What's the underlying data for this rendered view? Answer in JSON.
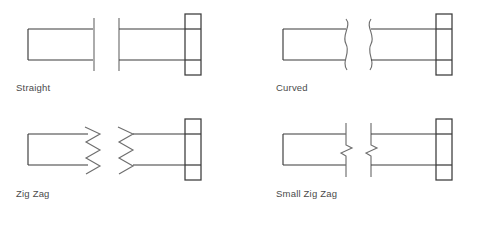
{
  "diagram": {
    "background_color": "#ffffff",
    "line_color": "#3a3a3a",
    "break_line_color": "#6e6e6e",
    "label_color": "#4a4a4a",
    "cells": [
      {
        "id": "straight",
        "label": "Straight",
        "break_style": "straight",
        "description": "Plain vertical break line on both fragments"
      },
      {
        "id": "curved",
        "label": "Curved",
        "break_style": "curved",
        "description": "S-curved freehand break line on both fragments"
      },
      {
        "id": "zig-zag",
        "label": "Zig Zag",
        "break_style": "zig-zag",
        "description": "Large amplitude chevron zig zag break line"
      },
      {
        "id": "small-zig-zag",
        "label": "Small Zig Zag",
        "break_style": "small-zig-zag",
        "description": "Straight break line with a small z kink at mid height"
      }
    ]
  }
}
